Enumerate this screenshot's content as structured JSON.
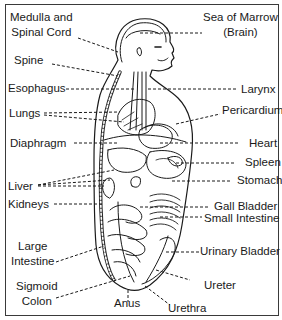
{
  "diagram": {
    "type": "anatomical-line-drawing",
    "colors": {
      "line": "#1a1a1a",
      "background": "#ffffff",
      "frame": "#3a3a3a"
    },
    "labels_left": [
      {
        "id": "medulla",
        "line1": "Medulla and",
        "line2": "Spinal Cord"
      },
      {
        "id": "spine",
        "text": "Spine"
      },
      {
        "id": "esophagus",
        "text": "Esophagus"
      },
      {
        "id": "lungs",
        "text": "Lungs"
      },
      {
        "id": "diaphragm",
        "text": "Diaphragm"
      },
      {
        "id": "liver",
        "text": "Liver"
      },
      {
        "id": "kidneys",
        "text": "Kidneys"
      },
      {
        "id": "large-intestine",
        "line1": "Large",
        "line2": "Intestine"
      },
      {
        "id": "sigmoid-colon",
        "line1": "Sigmoid",
        "line2": "Colon"
      }
    ],
    "labels_right": [
      {
        "id": "sea-of-marrow",
        "line1": "Sea of Marrow",
        "line2": "(Brain)"
      },
      {
        "id": "larynx",
        "text": "Larynx"
      },
      {
        "id": "pericardium",
        "text": "Pericardium"
      },
      {
        "id": "heart",
        "text": "Heart"
      },
      {
        "id": "spleen",
        "text": "Spleen"
      },
      {
        "id": "stomach",
        "text": "Stomach"
      },
      {
        "id": "gall-bladder",
        "text": "Gall Bladder"
      },
      {
        "id": "small-intestine",
        "text": "Small Intestine"
      },
      {
        "id": "urinary-bladder",
        "text": "Urinary Bladder"
      },
      {
        "id": "ureter",
        "text": "Ureter"
      }
    ],
    "labels_bottom": [
      {
        "id": "anus",
        "text": "Anus"
      },
      {
        "id": "urethra",
        "text": "Urethra"
      }
    ]
  }
}
